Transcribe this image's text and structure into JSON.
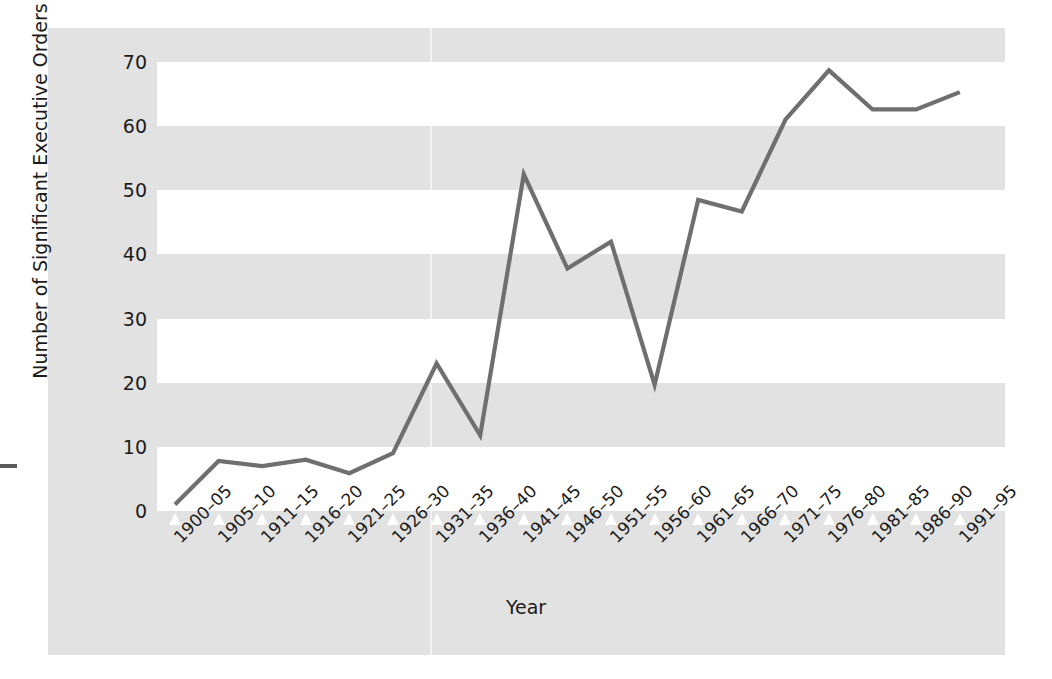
{
  "chart_data": {
    "type": "line",
    "title": "",
    "xlabel": "Year",
    "ylabel": "Number of Significant Executive Orders",
    "categories": [
      "1900–05",
      "1905–10",
      "1911–15",
      "1916–20",
      "1921–25",
      "1926–30",
      "1931–35",
      "1936–40",
      "1941–45",
      "1946–50",
      "1951–55",
      "1956–60",
      "1961–65",
      "1966–70",
      "1971–75",
      "1976–80",
      "1981–85",
      "1986–90",
      "1991–95"
    ],
    "values": [
      1,
      7.8,
      7.0,
      8.0,
      5.9,
      9.0,
      23.0,
      11.8,
      52.5,
      37.8,
      42.0,
      19.7,
      48.5,
      46.7,
      61.0,
      68.7,
      62.6,
      62.6,
      65.3
    ],
    "ylim": [
      0,
      70
    ],
    "yticks": [
      0,
      10,
      20,
      30,
      40,
      50,
      60,
      70
    ],
    "ytick_labels": [
      "0",
      "10",
      "20",
      "30",
      "40",
      "50",
      "60",
      "70"
    ],
    "grid": "alternating-horizontal-bands",
    "legend": "none",
    "series_color": "#6f6f6f",
    "band_color": "#ffffff",
    "panel_color": "#e2e2e2"
  },
  "figure": {
    "background": "#ffffff",
    "panel_background": "#e2e2e2"
  }
}
